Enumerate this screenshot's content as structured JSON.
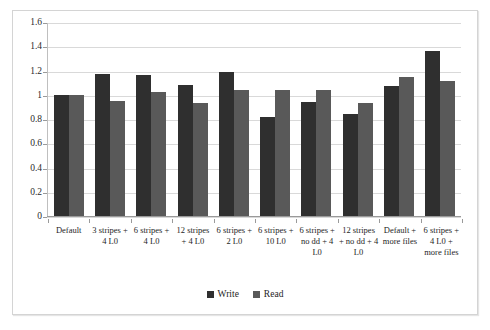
{
  "chart_data": {
    "type": "bar",
    "title": "",
    "xlabel": "",
    "ylabel": "",
    "ylim": [
      0,
      1.6
    ],
    "ytick_step": 0.2,
    "ytick_labels": [
      "1.6",
      "1.4",
      "1.2",
      "1",
      "0.8",
      "0.6",
      "0.4",
      "0.2",
      "0"
    ],
    "ytick_values": [
      1.6,
      1.4,
      1.2,
      1.0,
      0.8,
      0.6,
      0.4,
      0.2,
      0
    ],
    "grid": true,
    "legend_position": "bottom",
    "categories": [
      "Default",
      "3 stripes + 4 L0",
      "6 stripes + 4 L0",
      "12 stripes + 4 L0",
      "6 stripes + 2 L0",
      "6 stripes + 10 L0",
      "6 stripes + no dd + 4 L0",
      "12 stripes + no dd + 4 L0",
      "Default + more files",
      "6 stripes + 4 L0 + more files"
    ],
    "series": [
      {
        "name": "Write",
        "color": "#2f2f2f",
        "values": [
          1.0,
          1.17,
          1.16,
          1.08,
          1.19,
          0.82,
          0.94,
          0.84,
          1.07,
          1.36
        ]
      },
      {
        "name": "Read",
        "color": "#595959",
        "values": [
          1.0,
          0.95,
          1.02,
          0.93,
          1.04,
          1.04,
          1.04,
          0.93,
          1.15,
          1.11
        ]
      }
    ]
  },
  "legend": {
    "items": [
      {
        "label": "Write"
      },
      {
        "label": "Read"
      }
    ]
  }
}
